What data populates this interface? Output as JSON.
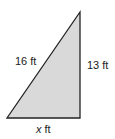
{
  "figure": {
    "shape": "right-triangle",
    "fill_color": "#d9d9d9",
    "stroke_color": "#222222",
    "vertices": {
      "apex": [
        80,
        12
      ],
      "bottom_left": [
        7,
        118
      ],
      "bottom_right": [
        80,
        118
      ]
    },
    "labels": {
      "hypotenuse": "16 ft",
      "vertical_leg": "13 ft",
      "base_var": "x",
      "base_unit": " ft"
    }
  }
}
